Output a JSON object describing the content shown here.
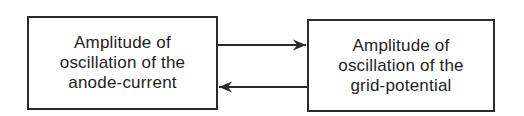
{
  "diagram": {
    "type": "feedback-loop",
    "nodes": [
      {
        "id": "anode",
        "lines": [
          "Amplitude of",
          "oscillation of the",
          "anode-current"
        ]
      },
      {
        "id": "grid",
        "lines": [
          "Amplitude of",
          "oscillation of the",
          "grid-potential"
        ]
      }
    ],
    "edges": [
      {
        "from": "anode",
        "to": "grid",
        "direction": "right"
      },
      {
        "from": "grid",
        "to": "anode",
        "direction": "left"
      }
    ],
    "colors": {
      "stroke": "#2b2b2b",
      "text": "#1e1e1e",
      "background": "#ffffff"
    }
  }
}
